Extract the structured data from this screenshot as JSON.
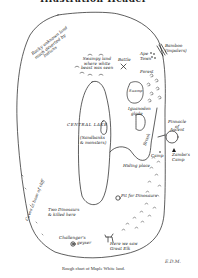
{
  "header": {
    "cut_title": "Illustration Header"
  },
  "map": {
    "title": "Rough chart of Maple White land.",
    "initials": "E.D.M.",
    "labels": {
      "rocky_ledge": [
        "Rocky unknown land",
        "much deserted by",
        "Indians"
      ],
      "swampy_land": [
        "Swampy land",
        "where white",
        "beast was seen"
      ],
      "battle": "Battle",
      "ape_town": [
        "Ape",
        "Town"
      ],
      "bamboo_impaled": [
        "Bamboo",
        "(impalers)"
      ],
      "forest": "Forest",
      "swamp": "Swamp",
      "iguanodon_glade": [
        "Iguanodon",
        "glade"
      ],
      "central_lake": "CENTRAL   LAKE",
      "sandbanks": [
        "(Sandbanks",
        "& monsters)"
      ],
      "brook": "Brook",
      "camp": "Camp",
      "pinnacle": [
        "Pinnacle",
        "of",
        "Ascent"
      ],
      "zambo_camp": [
        "Zambo's",
        "Camp"
      ],
      "hiding_place": "Hiding place",
      "pit_for_dinosaurs": "Pit for Dinosaurs",
      "caves_west_cliff": [
        "Caves",
        "at",
        "base",
        "of",
        "cliff"
      ],
      "two_dinosaurs": [
        "Two Dinosaurs",
        "& killed here"
      ],
      "challengers_geyser": [
        "Challenger's",
        "geyser"
      ],
      "great_elk": [
        "Here we saw",
        "Great Elk"
      ]
    }
  },
  "colors": {
    "ink": "#1a1a1a",
    "paper": "#ffffff"
  }
}
